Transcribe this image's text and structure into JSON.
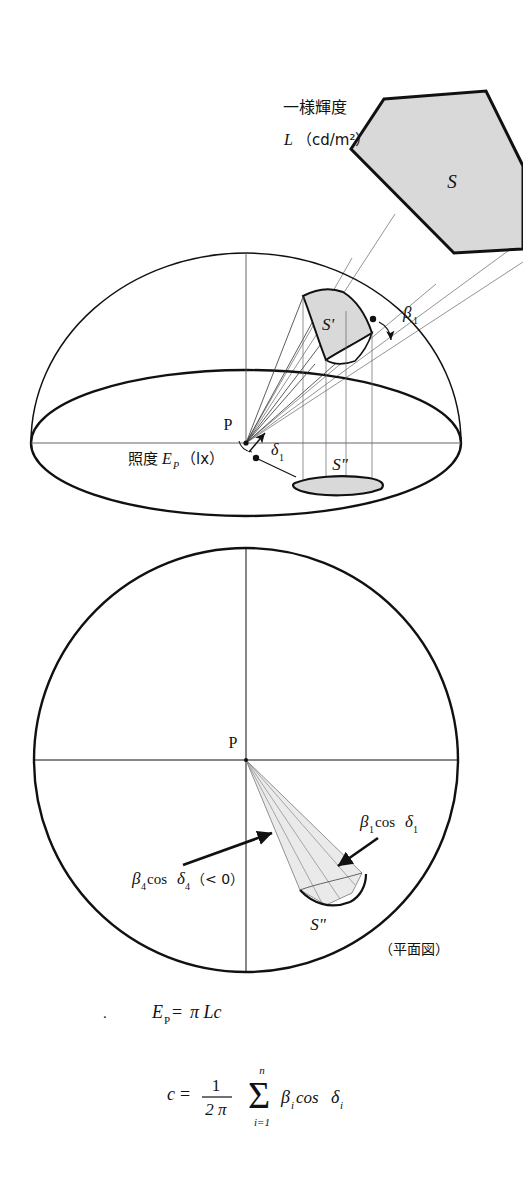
{
  "figure": {
    "title_note": "Illuminance at point P from a uniform-luminance surface S",
    "upper_diagram": {
      "name": "perspective-hemisphere-view",
      "luminance_label_line1": "一様輝度",
      "luminance_label_symbol": "L",
      "luminance_label_unit": "（cd/m²）",
      "source_surface_label": "S",
      "projected_patch_label": "S'",
      "base_projection_label": "S\"",
      "point_label": "P",
      "illuminance_label_jp": "照度",
      "illuminance_label_symbol": "E",
      "illuminance_label_subscript": "P",
      "illuminance_label_unit": "（lx）",
      "angle_beta_symbol": "β",
      "angle_beta_subscript": "1",
      "angle_delta_symbol": "δ",
      "angle_delta_subscript": "1"
    },
    "lower_diagram": {
      "name": "plan-view",
      "point_label": "P",
      "base_projection_label": "S\"",
      "annotation_right_symbol": "β",
      "annotation_right_sub": "1",
      "annotation_right_cos": "cos",
      "annotation_right_delta": "δ",
      "annotation_right_delta_sub": "1",
      "annotation_left_symbol": "β",
      "annotation_left_sub": "4",
      "annotation_left_cos": "cos",
      "annotation_left_delta": "δ",
      "annotation_left_delta_sub": "4",
      "annotation_left_condition": "（< 0）",
      "view_caption": "（平面図）"
    },
    "formulas": {
      "leading_dot": ".",
      "eq1_lhs": "E",
      "eq1_lhs_sub": "P",
      "eq1_eq": "=",
      "eq1_rhs": "π Lc",
      "eq2_lhs": "c",
      "eq2_eq": "=",
      "eq2_frac_num": "1",
      "eq2_frac_den": "2 π",
      "eq2_sum_symbol": "Σ",
      "eq2_sum_upper": "n",
      "eq2_sum_lower": "i=1",
      "eq2_term_beta": "β",
      "eq2_term_beta_sub": "i",
      "eq2_term_cos": "cos",
      "eq2_term_delta": "δ",
      "eq2_term_delta_sub": "i"
    },
    "colors": {
      "ink": "#111111",
      "shade_fill": "#d9d9d9",
      "shade_fill_light": "#e8e8e8",
      "thin_line": "#555555",
      "background": "#ffffff"
    }
  }
}
